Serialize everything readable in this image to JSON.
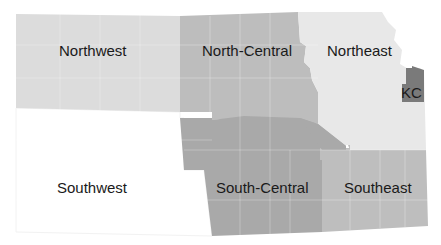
{
  "map": {
    "title": "Kansas regions",
    "regions": [
      {
        "id": "northwest",
        "label": "Northwest",
        "color": "#dcdcdc"
      },
      {
        "id": "north-central",
        "label": "North-Central",
        "color": "#bdbdbd"
      },
      {
        "id": "northeast",
        "label": "Northeast",
        "color": "#e8e8e8"
      },
      {
        "id": "kc",
        "label": "KC",
        "color": "#7a7a7a"
      },
      {
        "id": "southwest",
        "label": "Southwest",
        "color": "#ffffff"
      },
      {
        "id": "south-central",
        "label": "South-Central",
        "color": "#a9a9a9"
      },
      {
        "id": "southeast",
        "label": "Southeast",
        "color": "#bebebe"
      }
    ]
  }
}
